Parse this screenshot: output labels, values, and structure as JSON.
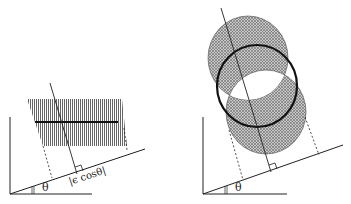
{
  "figure": {
    "left_panel": {
      "angle_label": "θ",
      "projection_label": "|ϵ cosθ|",
      "description": "Hatched thin slab with thick center line, projected onto inclined line"
    },
    "right_panel": {
      "angle_label": "θ",
      "description": "Hatched tilted cylinder with thick circular cross-section, projected onto inclined line"
    },
    "colors": {
      "stroke": "#222222",
      "hatch": "#555555",
      "background": "#ffffff"
    }
  }
}
